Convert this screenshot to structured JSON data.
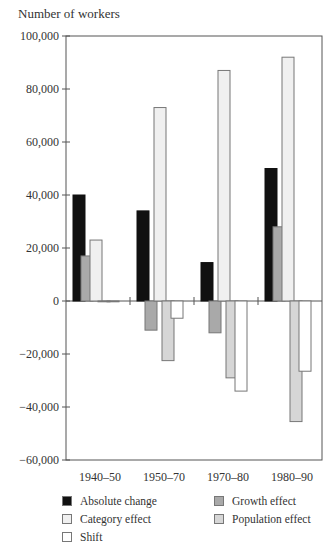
{
  "chart_data": {
    "type": "bar",
    "title": "",
    "ylabel": "Number of workers",
    "xlabel": "",
    "ylim": [
      -60000,
      100000
    ],
    "yticks": [
      -60000,
      -40000,
      -20000,
      0,
      20000,
      40000,
      60000,
      80000,
      100000
    ],
    "ytick_labels": [
      "−60,000",
      "−40,000",
      "−20,000",
      "0",
      "20,000",
      "40,000",
      "60,000",
      "80,000",
      "100,000"
    ],
    "categories": [
      "1940–50",
      "1950–70",
      "1970–80",
      "1980–90"
    ],
    "series": [
      {
        "name": "Absolute change",
        "color": "#111111",
        "values": [
          40000,
          34000,
          14500,
          50000
        ]
      },
      {
        "name": "Growth effect",
        "color": "#a9a9a9",
        "values": [
          17000,
          -11000,
          -12000,
          28000
        ]
      },
      {
        "name": "Category effect",
        "color": "#f0f0f0",
        "values": [
          23000,
          73000,
          87000,
          92000
        ]
      },
      {
        "name": "Population effect",
        "color": "#d6d6d6",
        "values": [
          -300,
          -22500,
          -29000,
          -45500
        ]
      },
      {
        "name": "Shift",
        "color": "#ffffff",
        "values": [
          -300,
          -6500,
          -34000,
          -26500
        ]
      }
    ],
    "grid": false,
    "legend_position": "bottom"
  },
  "legend": [
    {
      "label": "Absolute change",
      "color": "#111111",
      "col": 0,
      "row": 0
    },
    {
      "label": "Category effect",
      "color": "#f0f0f0",
      "col": 0,
      "row": 1
    },
    {
      "label": "Shift",
      "color": "#ffffff",
      "col": 0,
      "row": 2
    },
    {
      "label": "Growth effect",
      "color": "#a9a9a9",
      "col": 1,
      "row": 0
    },
    {
      "label": "Population effect",
      "color": "#d6d6d6",
      "col": 1,
      "row": 1
    }
  ]
}
